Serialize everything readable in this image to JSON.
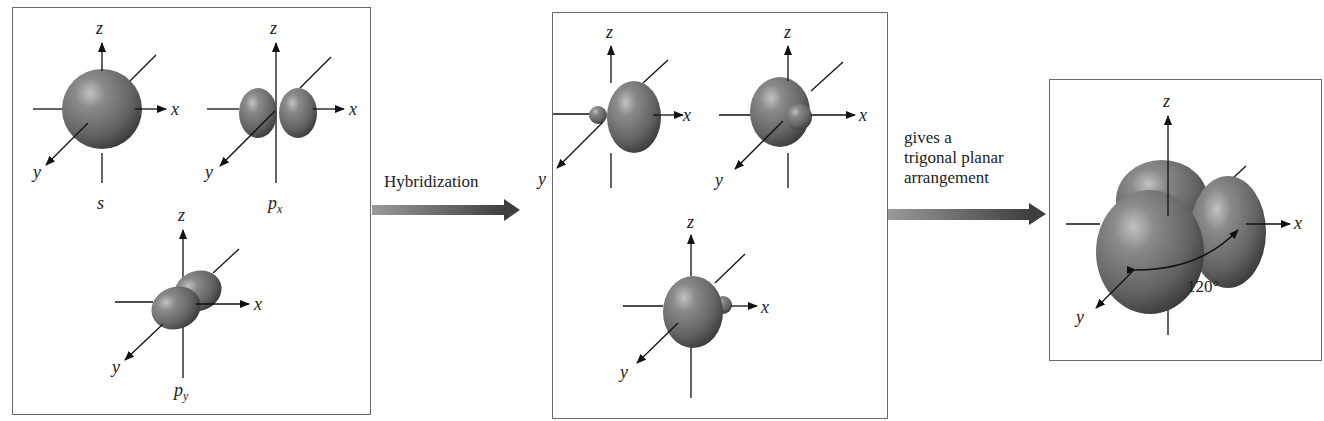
{
  "diagram": {
    "left_panel": {
      "orbitals": [
        {
          "id": "s",
          "label": "s",
          "subscript": "",
          "axes": {
            "z": "z",
            "x": "x",
            "y": "y"
          }
        },
        {
          "id": "px",
          "label": "p",
          "subscript": "x",
          "axes": {
            "z": "z",
            "x": "x",
            "y": "y"
          }
        },
        {
          "id": "py",
          "label": "p",
          "subscript": "y",
          "axes": {
            "z": "z",
            "x": "x",
            "y": "y"
          }
        }
      ]
    },
    "arrow1": {
      "label": "Hybridization"
    },
    "middle_panel": {
      "orbitals": [
        {
          "id": "sp2-1",
          "axes": {
            "z": "z",
            "x": "x",
            "y": "y"
          }
        },
        {
          "id": "sp2-2",
          "axes": {
            "z": "z",
            "x": "x",
            "y": "y"
          }
        },
        {
          "id": "sp2-3",
          "axes": {
            "z": "z",
            "x": "x",
            "y": "y"
          }
        }
      ]
    },
    "arrow2": {
      "line1": "gives a",
      "line2": "trigonal planar",
      "line3": "arrangement"
    },
    "right_panel": {
      "axes": {
        "z": "z",
        "x": "x",
        "y": "y"
      },
      "angle_label": "120°"
    },
    "colors": {
      "orbital_fill": "#6b6b6b",
      "orbital_highlight": "#b5b5b5",
      "orbital_shadow": "#3c3c3c",
      "arrow": "#4a4a4a",
      "border": "#6a6a6a"
    }
  }
}
